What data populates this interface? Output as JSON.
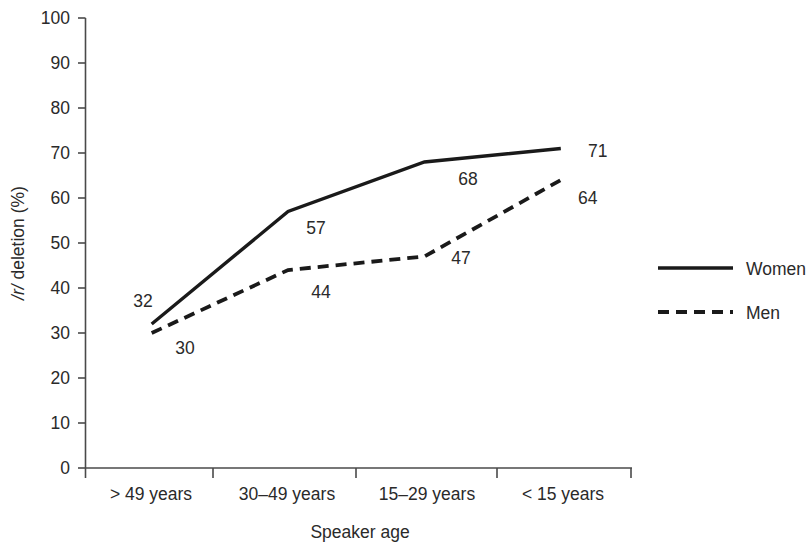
{
  "chart_data": {
    "type": "line",
    "title": "",
    "xlabel": "Speaker age",
    "ylabel": "/r/ deletion (%)",
    "ylabel_italic_part": "/r/",
    "ylabel_rest": " deletion (%)",
    "categories": [
      "> 49 years",
      "30–49 years",
      "15–29 years",
      "< 15 years"
    ],
    "ylim": [
      0,
      100
    ],
    "ytick_values": [
      "100",
      "90",
      "80",
      "70",
      "60",
      "50",
      "40",
      "30",
      "20",
      "10",
      "0"
    ],
    "grid": false,
    "legend_position": "right",
    "series": [
      {
        "name": "Women",
        "style": "solid",
        "values": [
          32,
          57,
          68,
          71
        ],
        "labels": [
          "32",
          "57",
          "68",
          "71"
        ]
      },
      {
        "name": "Men",
        "style": "dashed",
        "values": [
          30,
          44,
          47,
          64
        ],
        "labels": [
          "30",
          "44",
          "47",
          "64"
        ]
      }
    ]
  },
  "legend": {
    "items": [
      {
        "label": "Women",
        "style": "solid"
      },
      {
        "label": "Men",
        "style": "dashed"
      }
    ]
  },
  "colors": {
    "line": "#1a1a1a",
    "axis": "#4a4a4a",
    "text": "#2a2a2a",
    "background": "#ffffff"
  }
}
